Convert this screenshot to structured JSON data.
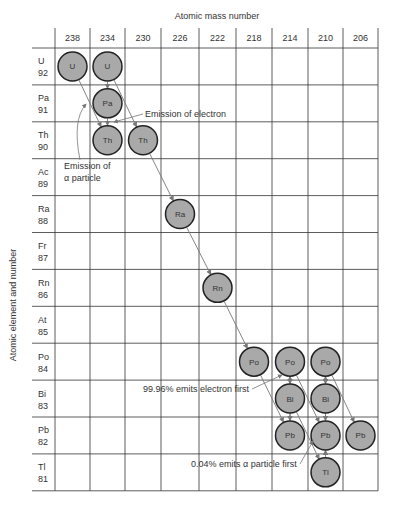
{
  "x_axis": {
    "title": "Atomic mass number",
    "ticks": [
      "238",
      "234",
      "230",
      "226",
      "222",
      "218",
      "214",
      "210",
      "206"
    ]
  },
  "y_axis": {
    "title": "Atomic element and number",
    "rows": [
      {
        "symbol": "U",
        "number": "92"
      },
      {
        "symbol": "Pa",
        "number": "91"
      },
      {
        "symbol": "Th",
        "number": "90"
      },
      {
        "symbol": "Ac",
        "number": "89"
      },
      {
        "symbol": "Ra",
        "number": "88"
      },
      {
        "symbol": "Fr",
        "number": "87"
      },
      {
        "symbol": "Rn",
        "number": "86"
      },
      {
        "symbol": "At",
        "number": "85"
      },
      {
        "symbol": "Po",
        "number": "84"
      },
      {
        "symbol": "Bi",
        "number": "83"
      },
      {
        "symbol": "Pb",
        "number": "82"
      },
      {
        "symbol": "Tl",
        "number": "81"
      }
    ]
  },
  "nuclides": [
    {
      "label": "U",
      "col": 0,
      "row": 0
    },
    {
      "label": "U",
      "col": 1,
      "row": 0
    },
    {
      "label": "Pa",
      "col": 1,
      "row": 1
    },
    {
      "label": "Th",
      "col": 1,
      "row": 2
    },
    {
      "label": "Th",
      "col": 2,
      "row": 2
    },
    {
      "label": "Ra",
      "col": 3,
      "row": 4
    },
    {
      "label": "Rn",
      "col": 4,
      "row": 6
    },
    {
      "label": "Po",
      "col": 5,
      "row": 8
    },
    {
      "label": "Po",
      "col": 6,
      "row": 8
    },
    {
      "label": "Po",
      "col": 7,
      "row": 8
    },
    {
      "label": "Bi",
      "col": 6,
      "row": 9
    },
    {
      "label": "Bi",
      "col": 7,
      "row": 9
    },
    {
      "label": "Pb",
      "col": 6,
      "row": 10
    },
    {
      "label": "Pb",
      "col": 7,
      "row": 10
    },
    {
      "label": "Pb",
      "col": 8,
      "row": 10
    },
    {
      "label": "Tl",
      "col": 7,
      "row": 11
    }
  ],
  "annotations": {
    "electron": "Emission of electron",
    "alpha_1": "Emission of",
    "alpha_2": "α particle",
    "electron_first": "99.96% emits electron first",
    "alpha_first": "0.04% emits α particle first"
  },
  "colors": {
    "nuclide_fill": "#a9a9a9",
    "nuclide_stroke": "#222222",
    "grid": "#333333",
    "arrow": "#777777"
  }
}
